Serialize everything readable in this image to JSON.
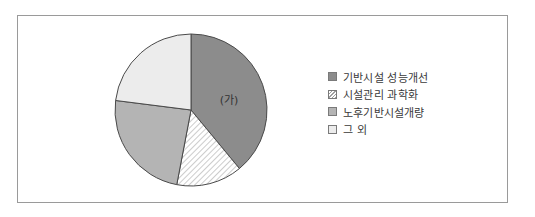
{
  "chart_data": {
    "type": "pie",
    "title": "",
    "start_angle": "12 o'clock, clockwise",
    "slices": [
      {
        "name": "기반시설 성능개선",
        "value": 39,
        "label": "(가)",
        "fill": "#8c8c8c",
        "pattern": "solid"
      },
      {
        "name": "시설관리 과학화",
        "value": 14,
        "label": "",
        "fill": "#ffffff",
        "pattern": "diagonal-hatch"
      },
      {
        "name": "노후기반시설개량",
        "value": 24,
        "label": "",
        "fill": "#b4b4b4",
        "pattern": "solid"
      },
      {
        "name": "그 외",
        "value": 23,
        "label": "",
        "fill": "#ececec",
        "pattern": "solid"
      }
    ],
    "legend": [
      "기반시설 성능개선",
      "시설관리 과학화",
      "노후기반시설개량",
      "그 외"
    ],
    "legend_position": "right",
    "units": "percent (estimated from angles)"
  },
  "legend": {
    "items": [
      {
        "label": "기반시설 성능개선"
      },
      {
        "label": "시설관리 과학화"
      },
      {
        "label": "노후기반시설개량"
      },
      {
        "label": "그 외"
      }
    ]
  },
  "annotations": {
    "slice_label": "(가)"
  }
}
